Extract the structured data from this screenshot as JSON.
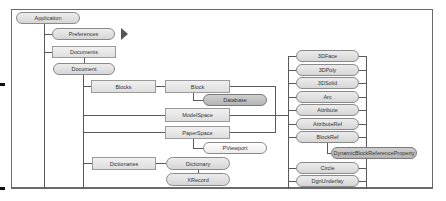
{
  "diagram": {
    "nodes": {
      "application": "Application",
      "preferences": "Preferences",
      "documents": "Documents",
      "document": "Document",
      "blocks": "Blocks",
      "block": "Block",
      "database": "Database",
      "modelspace": "ModelSpace",
      "paperspace": "PaperSpace",
      "pviewport": "PViewport",
      "dictionaries": "Dictionaries",
      "dictionary": "Dictionary",
      "xrecord": "XRecord"
    },
    "entities": [
      "3DFace",
      "3DPoly",
      "3DSolid",
      "Arc",
      "Attribute",
      "AttributeRef",
      "BlockRef",
      "Circle",
      "DgnUnderlay"
    ],
    "blockref_child": "DynamicBlockReferenceProperty",
    "continuation_arrow": "triangle-right-icon",
    "colors": {
      "line": "#5a5a5a",
      "node_fill": "#e0e0e0",
      "node_dark_fill": "#c2c2c2",
      "frame": "#6a6a6a"
    }
  }
}
